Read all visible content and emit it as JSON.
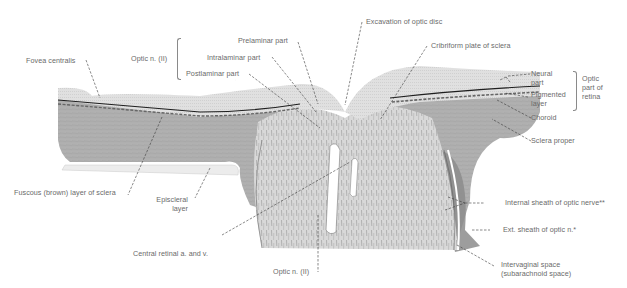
{
  "figure": {
    "colors": {
      "background": "#ffffff",
      "label_text": "#6a6a6a",
      "leader_line": "#3a3a3a",
      "retina_neural": "#dcdcdc",
      "pigment_line": "#1e1e1e",
      "choroid": "#9a9a9a",
      "sclera": "#b4b4b4",
      "nerve_fibers": "#d6d6d6",
      "episcleral": "#ececec"
    },
    "labels": {
      "fovea_centralis": "Fovea centralis",
      "optic_n_group": "Optic n. (II)",
      "prelaminar_part": "Prelaminar part",
      "intralaminar_part": "Intralaminar part",
      "postlaminar_part": "Postlaminar part",
      "excavation_optic_disc": "Excavation of optic disc",
      "cribriform_plate": "Cribriform plate of sclera",
      "neural_part_1": "Neural",
      "neural_part_2": "part",
      "pigmented_layer_1": "Pigmented",
      "pigmented_layer_2": "layer",
      "optic_part_retina_1": "Optic",
      "optic_part_retina_2": "part of",
      "optic_part_retina_3": "retina",
      "choroid": "Choroid",
      "sclera_proper": "Sclera proper",
      "fuscous_layer": "Fuscous (brown) layer of sclera",
      "episcleral_layer_1": "Episcleral",
      "episcleral_layer_2": "layer",
      "internal_sheath": "Internal sheath of optic nerve**",
      "external_sheath": "Ext. sheath of optic n.*",
      "central_retinal": "Central retinal a. and v.",
      "optic_n_bottom": "Optic n. (II)",
      "intervaginal_1": "Intervaginal space",
      "intervaginal_2": "(subarachnoid space)"
    }
  }
}
